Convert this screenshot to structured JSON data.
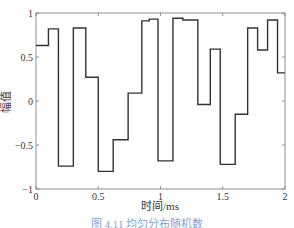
{
  "chart_data": {
    "type": "line",
    "style": "step",
    "title": "",
    "xlabel": "时间/ms",
    "ylabel": "幅值",
    "xlim": [
      0,
      2
    ],
    "ylim": [
      -1,
      1
    ],
    "xticks": [
      "0",
      "0.5",
      "1",
      "1.5",
      "2"
    ],
    "yticks": [
      "-1",
      "-0.5",
      "0",
      "0.5",
      "1"
    ],
    "grid": false,
    "steps": [
      {
        "x0": 0.0,
        "x1": 0.1,
        "y": 0.63
      },
      {
        "x0": 0.1,
        "x1": 0.18,
        "y": 0.82
      },
      {
        "x0": 0.18,
        "x1": 0.3,
        "y": -0.74
      },
      {
        "x0": 0.3,
        "x1": 0.4,
        "y": 0.83
      },
      {
        "x0": 0.4,
        "x1": 0.5,
        "y": 0.27
      },
      {
        "x0": 0.5,
        "x1": 0.62,
        "y": -0.8
      },
      {
        "x0": 0.62,
        "x1": 0.74,
        "y": -0.44
      },
      {
        "x0": 0.74,
        "x1": 0.85,
        "y": 0.09
      },
      {
        "x0": 0.85,
        "x1": 0.91,
        "y": 0.91
      },
      {
        "x0": 0.91,
        "x1": 0.98,
        "y": 0.93
      },
      {
        "x0": 0.98,
        "x1": 1.1,
        "y": -0.68
      },
      {
        "x0": 1.1,
        "x1": 1.18,
        "y": 0.94
      },
      {
        "x0": 1.18,
        "x1": 1.3,
        "y": 0.92
      },
      {
        "x0": 1.3,
        "x1": 1.4,
        "y": -0.04
      },
      {
        "x0": 1.4,
        "x1": 1.48,
        "y": 0.59
      },
      {
        "x0": 1.48,
        "x1": 1.6,
        "y": -0.72
      },
      {
        "x0": 1.6,
        "x1": 1.7,
        "y": -0.15
      },
      {
        "x0": 1.7,
        "x1": 1.78,
        "y": 0.83
      },
      {
        "x0": 1.78,
        "x1": 1.86,
        "y": 0.58
      },
      {
        "x0": 1.86,
        "x1": 1.94,
        "y": 0.92
      },
      {
        "x0": 1.94,
        "x1": 2.0,
        "y": 0.32
      }
    ]
  },
  "caption": "图 4.11  均匀分布随机数"
}
